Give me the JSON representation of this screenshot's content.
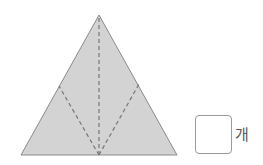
{
  "figure": {
    "shape": "triangle",
    "fill_color": "#d3d3d3",
    "stroke_color": "#8a8a8a",
    "dash_color": "#777777",
    "vertices": {
      "apex": [
        99,
        15
      ],
      "left": [
        21,
        155
      ],
      "right": [
        177,
        155
      ]
    },
    "fold_lines": [
      {
        "from": [
          99,
          155
        ],
        "to": [
          99,
          15
        ]
      },
      {
        "from": [
          99,
          155
        ],
        "to": [
          59,
          86
        ]
      },
      {
        "from": [
          99,
          155
        ],
        "to": [
          139,
          84
        ]
      }
    ]
  },
  "answer": {
    "value": "",
    "unit": "개"
  }
}
